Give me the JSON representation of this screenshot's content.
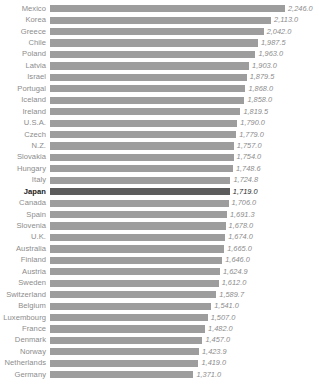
{
  "chart_data": {
    "type": "bar",
    "orientation": "horizontal",
    "title": "",
    "subtitle": "",
    "xlabel": "",
    "ylabel": "",
    "grid": false,
    "legend": null,
    "xlim": [
      0,
      2246
    ],
    "highlight_category": "Japan",
    "colors": {
      "bar": "#9d9d9d",
      "bar_highlight": "#5c5c5c",
      "label": "#8c8c8c",
      "label_highlight": "#1a1a1a",
      "background": "#ffffff"
    },
    "categories": [
      "Mexico",
      "Korea",
      "Greece",
      "Chile",
      "Poland",
      "Latvia",
      "Israel",
      "Portugal",
      "Iceland",
      "Ireland",
      "U.S.A.",
      "Czech",
      "N.Z.",
      "Slovakia",
      "Hungary",
      "Italy",
      "Japan",
      "Canada",
      "Spain",
      "Slovenia",
      "U.K.",
      "Australia",
      "Finland",
      "Austria",
      "Sweden",
      "Switzerland",
      "Belgium",
      "Luxembourg",
      "France",
      "Denmark",
      "Norway",
      "Netherlands",
      "Germany"
    ],
    "values": [
      2246.0,
      2113.0,
      2042.0,
      1987.5,
      1963.0,
      1903.0,
      1879.5,
      1868.0,
      1858.0,
      1819.5,
      1790.0,
      1779.0,
      1757.0,
      1754.0,
      1748.6,
      1724.8,
      1719.0,
      1706.0,
      1691.3,
      1678.0,
      1674.0,
      1665.0,
      1646.0,
      1624.9,
      1612.0,
      1589.7,
      1541.0,
      1507.0,
      1482.0,
      1457.0,
      1423.9,
      1419.0,
      1371.0
    ],
    "value_labels": [
      "2,246.0",
      "2,113.0",
      "2,042.0",
      "1,987.5",
      "1,963.0",
      "1,903.0",
      "1,879.5",
      "1,868.0",
      "1,858.0",
      "1,819.5",
      "1,790.0",
      "1,779.0",
      "1,757.0",
      "1,754.0",
      "1,748.6",
      "1,724.8",
      "1,719.0",
      "1,706.0",
      "1,691.3",
      "1,678.0",
      "1,674.0",
      "1,665.0",
      "1,646.0",
      "1,624.9",
      "1,612.0",
      "1,589.7",
      "1,541.0",
      "1,507.0",
      "1,482.0",
      "1,457.0",
      "1,423.9",
      "1,419.0",
      "1,371.0"
    ]
  }
}
